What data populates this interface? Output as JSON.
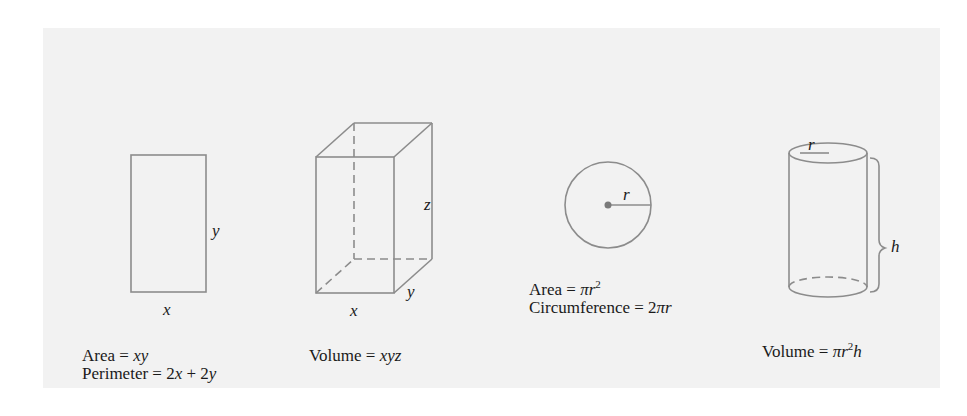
{
  "figures": {
    "rectangle": {
      "label_x": "x",
      "label_y": "y",
      "area_prefix": "Area = ",
      "area_expr": "xy",
      "perimeter_prefix": "Perimeter = ",
      "perimeter_p1": "2",
      "perimeter_v1": "x",
      "perimeter_mid": " + 2",
      "perimeter_v2": "y"
    },
    "box": {
      "label_x": "x",
      "label_y": "y",
      "label_z": "z",
      "volume_prefix": "Volume = ",
      "volume_expr": "xyz"
    },
    "circle": {
      "label_r": "r",
      "area_prefix": "Area = ",
      "area_expr": "πr",
      "area_exp": "2",
      "circumference_prefix": "Circumference = ",
      "circumference_num": "2",
      "circumference_expr": "πr"
    },
    "cylinder": {
      "label_r": "r",
      "label_h": "h",
      "volume_prefix": "Volume = ",
      "volume_expr1": "πr",
      "volume_exp": "2",
      "volume_expr2": "h"
    }
  },
  "colors": {
    "panel_bg": "#f2f2f2",
    "stroke": "#8a8a8a",
    "text": "#1a1a1a"
  }
}
